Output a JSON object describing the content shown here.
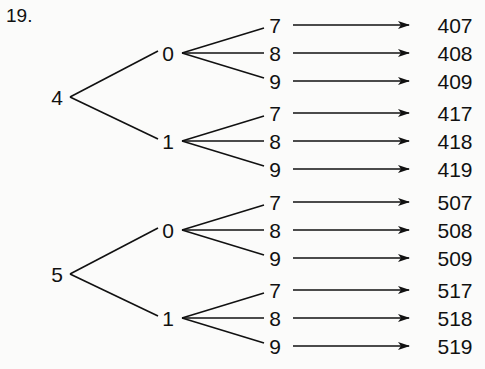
{
  "problem_number": "19.",
  "tree": {
    "roots": [
      {
        "digit": "4",
        "branches": [
          {
            "digit": "0",
            "leaves": [
              {
                "digit": "7",
                "result": "407"
              },
              {
                "digit": "8",
                "result": "408"
              },
              {
                "digit": "9",
                "result": "409"
              }
            ]
          },
          {
            "digit": "1",
            "leaves": [
              {
                "digit": "7",
                "result": "417"
              },
              {
                "digit": "8",
                "result": "418"
              },
              {
                "digit": "9",
                "result": "419"
              }
            ]
          }
        ]
      },
      {
        "digit": "5",
        "branches": [
          {
            "digit": "0",
            "leaves": [
              {
                "digit": "7",
                "result": "507"
              },
              {
                "digit": "8",
                "result": "508"
              },
              {
                "digit": "9",
                "result": "509"
              }
            ]
          },
          {
            "digit": "1",
            "leaves": [
              {
                "digit": "7",
                "result": "517"
              },
              {
                "digit": "8",
                "result": "518"
              },
              {
                "digit": "9",
                "result": "519"
              }
            ]
          }
        ]
      }
    ]
  },
  "colors": {
    "ink": "#111111",
    "background": "#fbfbfa"
  }
}
